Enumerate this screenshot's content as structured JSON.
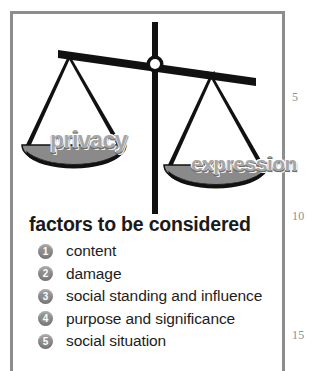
{
  "figure": {
    "alt_name": "balance-scale",
    "left_pan_label": "privacy",
    "right_pan_label": "expression",
    "tilt": "right-side-down",
    "colors": {
      "scale_black": "#111111",
      "pan_gray": "#8a8a8a",
      "word_gray": "#a6a6a6",
      "frame_gray": "#8d8d8d",
      "bullet_gray": "#8e8e8e",
      "line_number_gray": "#8e8e8e"
    }
  },
  "heading": "factors to be considered",
  "factors": [
    {
      "number": "1",
      "label": "content"
    },
    {
      "number": "2",
      "label": "damage"
    },
    {
      "number": "3",
      "label": "social standing and influence"
    },
    {
      "number": "4",
      "label": "purpose and significance"
    },
    {
      "number": "5",
      "label": "social situation"
    }
  ],
  "line_numbers": {
    "n5": "5",
    "n10": "10",
    "n15": "15"
  }
}
